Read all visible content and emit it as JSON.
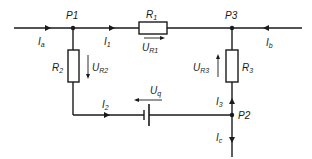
{
  "diagram": {
    "type": "circuit",
    "nodes": [
      {
        "id": "P1",
        "label": "P1"
      },
      {
        "id": "P2",
        "label": "P2"
      },
      {
        "id": "P3",
        "label": "P3"
      }
    ],
    "components": {
      "R1": {
        "main": "R",
        "sub": "1"
      },
      "R2": {
        "main": "R",
        "sub": "2"
      },
      "R3": {
        "main": "R",
        "sub": "3"
      }
    },
    "voltages": {
      "UR1": {
        "main": "U",
        "sub": "R1"
      },
      "UR2": {
        "main": "U",
        "sub": "R2"
      },
      "UR3": {
        "main": "U",
        "sub": "R3"
      },
      "Uq": {
        "main": "U",
        "sub": "q"
      }
    },
    "currents": {
      "Ia": {
        "main": "I",
        "sub": "a"
      },
      "Ib": {
        "main": "I",
        "sub": "b"
      },
      "Ic": {
        "main": "I",
        "sub": "c"
      },
      "I1": {
        "main": "I",
        "sub": "1"
      },
      "I2": {
        "main": "I",
        "sub": "2"
      },
      "I3": {
        "main": "I",
        "sub": "3"
      }
    },
    "colors": {
      "line": "#1a1a1a",
      "background": "#ffffff"
    }
  }
}
